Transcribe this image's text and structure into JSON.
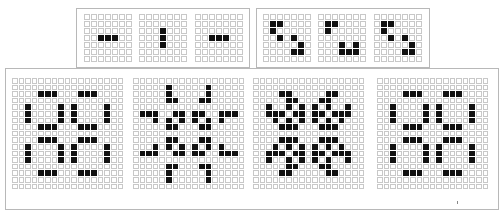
{
  "colors": {
    "live": "#111111",
    "dead": "#ffffff",
    "gridline": "#c8c8c8",
    "frame": "#b8b8b8"
  },
  "frames": [
    {
      "name": "blinker-frame",
      "oscillator": "blinker",
      "period": 2,
      "box": {
        "x": 76,
        "y": 8,
        "w": 174,
        "h": 60
      },
      "grid_size": 7,
      "cell_px": 6,
      "seed": [
        [
          3,
          2
        ],
        [
          3,
          3
        ],
        [
          3,
          4
        ]
      ],
      "panels": [
        {
          "x": 84,
          "y": 14,
          "generation": 0
        },
        {
          "x": 139,
          "y": 14,
          "generation": 1
        },
        {
          "x": 195,
          "y": 14,
          "generation": 2
        }
      ]
    },
    {
      "name": "beacon-frame",
      "oscillator": "beacon",
      "period": 2,
      "box": {
        "x": 256,
        "y": 8,
        "w": 174,
        "h": 60
      },
      "grid_size": 7,
      "cell_px": 6,
      "seed": [
        [
          1,
          1
        ],
        [
          1,
          2
        ],
        [
          2,
          1
        ],
        [
          4,
          4
        ],
        [
          4,
          5
        ],
        [
          5,
          4
        ],
        [
          5,
          5
        ],
        [
          3,
          3
        ]
      ],
      "explicit_panels": [
        [
          [
            1,
            1
          ],
          [
            1,
            2
          ],
          [
            2,
            1
          ],
          [
            3,
            2
          ],
          [
            3,
            4
          ],
          [
            4,
            5
          ],
          [
            5,
            4
          ],
          [
            5,
            5
          ]
        ],
        [
          [
            1,
            1
          ],
          [
            1,
            2
          ],
          [
            2,
            1
          ],
          [
            4,
            5
          ],
          [
            5,
            4
          ],
          [
            5,
            5
          ],
          [
            4,
            3
          ],
          [
            5,
            3
          ]
        ],
        [
          [
            1,
            1
          ],
          [
            1,
            2
          ],
          [
            2,
            1
          ],
          [
            3,
            2
          ],
          [
            3,
            4
          ],
          [
            4,
            5
          ],
          [
            5,
            4
          ],
          [
            5,
            5
          ]
        ]
      ],
      "panels": [
        {
          "x": 263,
          "y": 14
        },
        {
          "x": 318,
          "y": 14
        },
        {
          "x": 374,
          "y": 14
        }
      ]
    },
    {
      "name": "pulsar-frame",
      "oscillator": "pulsar",
      "period": 3,
      "box": {
        "x": 5,
        "y": 68,
        "w": 494,
        "h": 142
      },
      "grid_size": 17,
      "cell_px": 5.6,
      "seed": [
        [
          2,
          4
        ],
        [
          2,
          5
        ],
        [
          2,
          6
        ],
        [
          2,
          10
        ],
        [
          2,
          11
        ],
        [
          2,
          12
        ],
        [
          7,
          4
        ],
        [
          7,
          5
        ],
        [
          7,
          6
        ],
        [
          7,
          10
        ],
        [
          7,
          11
        ],
        [
          7,
          12
        ],
        [
          9,
          4
        ],
        [
          9,
          5
        ],
        [
          9,
          6
        ],
        [
          9,
          10
        ],
        [
          9,
          11
        ],
        [
          9,
          12
        ],
        [
          14,
          4
        ],
        [
          14,
          5
        ],
        [
          14,
          6
        ],
        [
          14,
          10
        ],
        [
          14,
          11
        ],
        [
          14,
          12
        ],
        [
          4,
          2
        ],
        [
          5,
          2
        ],
        [
          6,
          2
        ],
        [
          10,
          2
        ],
        [
          11,
          2
        ],
        [
          12,
          2
        ],
        [
          4,
          7
        ],
        [
          5,
          7
        ],
        [
          6,
          7
        ],
        [
          10,
          7
        ],
        [
          11,
          7
        ],
        [
          12,
          7
        ],
        [
          4,
          9
        ],
        [
          5,
          9
        ],
        [
          6,
          9
        ],
        [
          10,
          9
        ],
        [
          11,
          9
        ],
        [
          12,
          9
        ],
        [
          4,
          14
        ],
        [
          5,
          14
        ],
        [
          6,
          14
        ],
        [
          10,
          14
        ],
        [
          11,
          14
        ],
        [
          12,
          14
        ]
      ],
      "panels": [
        {
          "x": 12,
          "y": 78,
          "generation": 0
        },
        {
          "x": 133,
          "y": 78,
          "generation": 1
        },
        {
          "x": 253,
          "y": 78,
          "generation": 2
        },
        {
          "x": 377,
          "y": 78,
          "generation": 3
        }
      ]
    }
  ],
  "footnote_mark": {
    "x": 457,
    "y": 201
  }
}
